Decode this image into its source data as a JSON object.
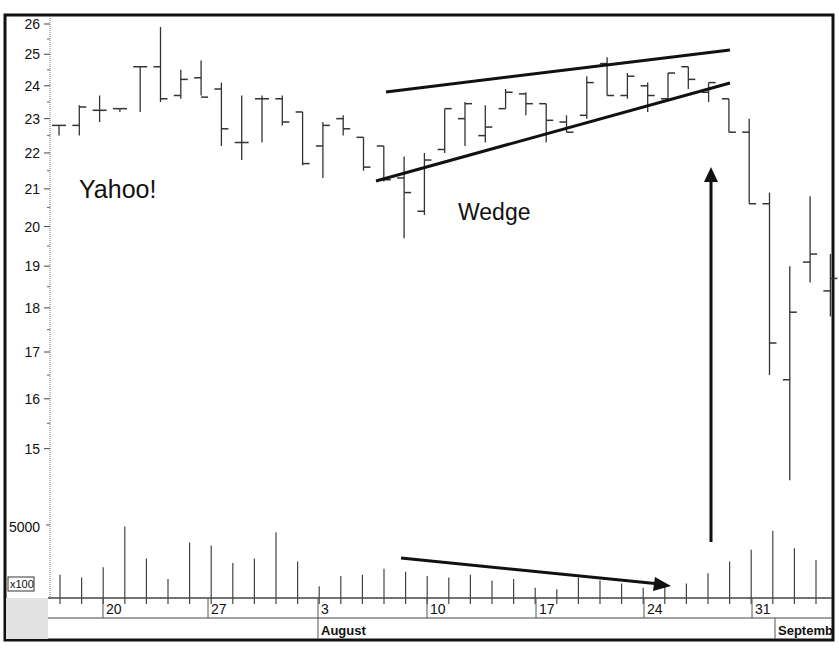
{
  "chart_data": {
    "type": "ohlc",
    "title": "",
    "annotations": {
      "stock_label": "Yahoo!",
      "pattern_label": "Wedge",
      "volume_multiplier_label": "x100"
    },
    "y_axis": {
      "scale": "log",
      "ticks": [
        26,
        25,
        24,
        23,
        22,
        21,
        20,
        19,
        18,
        17,
        16,
        15
      ],
      "ylim": [
        14.2,
        26.3
      ]
    },
    "volume_axis": {
      "ticks": [
        5000
      ],
      "unit": "x100"
    },
    "x_axis": {
      "day_ticks": [
        "20",
        "27",
        "3",
        "10",
        "17",
        "24",
        "31"
      ],
      "month_labels": [
        "August",
        "Septemb"
      ]
    },
    "bars": [
      {
        "date": "Jul 17",
        "open": 22.8,
        "high": 22.8,
        "low": 22.5,
        "close": 22.8
      },
      {
        "date": "Jul 18",
        "open": 22.8,
        "high": 23.4,
        "low": 22.5,
        "close": 23.35
      },
      {
        "date": "Jul 19",
        "open": 23.25,
        "high": 23.7,
        "low": 22.9,
        "close": 23.25
      },
      {
        "date": "Jul 20",
        "open": 23.3,
        "high": 23.3,
        "low": 23.2,
        "close": 23.3
      },
      {
        "date": "Jul 23",
        "open": 24.6,
        "high": 24.6,
        "low": 23.2,
        "close": 24.6
      },
      {
        "date": "Jul 24",
        "open": 24.6,
        "high": 25.9,
        "low": 23.5,
        "close": 23.6
      },
      {
        "date": "Jul 25",
        "open": 23.7,
        "high": 24.5,
        "low": 23.6,
        "close": 24.2
      },
      {
        "date": "Jul 26",
        "open": 24.25,
        "high": 24.8,
        "low": 23.7,
        "close": 23.65
      },
      {
        "date": "Jul 27",
        "open": 23.9,
        "high": 24.1,
        "low": 22.2,
        "close": 22.7
      },
      {
        "date": "Jul 30",
        "open": 22.3,
        "high": 23.7,
        "low": 21.8,
        "close": 22.3
      },
      {
        "date": "Jul 31",
        "open": 23.6,
        "high": 23.7,
        "low": 22.3,
        "close": 23.6
      },
      {
        "date": "Aug 1",
        "open": 23.6,
        "high": 23.7,
        "low": 22.8,
        "close": 22.9
      },
      {
        "date": "Aug 2",
        "open": 23.2,
        "high": 23.2,
        "low": 21.65,
        "close": 21.7
      },
      {
        "date": "Aug 3",
        "open": 22.2,
        "high": 22.9,
        "low": 21.3,
        "close": 22.8
      },
      {
        "date": "Aug 6",
        "open": 23.0,
        "high": 23.1,
        "low": 22.5,
        "close": 22.7
      },
      {
        "date": "Aug 7",
        "open": 22.45,
        "high": 22.45,
        "low": 21.5,
        "close": 21.6
      },
      {
        "date": "Aug 8",
        "open": 22.2,
        "high": 22.2,
        "low": 21.2,
        "close": 21.25
      },
      {
        "date": "Aug 9",
        "open": 21.3,
        "high": 21.9,
        "low": 19.7,
        "close": 20.9
      },
      {
        "date": "Aug 10",
        "open": 20.4,
        "high": 22.0,
        "low": 20.3,
        "close": 21.8
      },
      {
        "date": "Aug 13",
        "open": 22.1,
        "high": 23.3,
        "low": 22.0,
        "close": 23.3
      },
      {
        "date": "Aug 14",
        "open": 23.0,
        "high": 23.5,
        "low": 22.2,
        "close": 23.45
      },
      {
        "date": "Aug 15",
        "open": 22.5,
        "high": 23.4,
        "low": 22.3,
        "close": 22.75
      },
      {
        "date": "Aug 16",
        "open": 23.3,
        "high": 23.9,
        "low": 23.3,
        "close": 23.8
      },
      {
        "date": "Aug 17",
        "open": 23.75,
        "high": 23.8,
        "low": 23.1,
        "close": 23.45
      },
      {
        "date": "Aug 20",
        "open": 23.45,
        "high": 23.45,
        "low": 22.3,
        "close": 22.95
      },
      {
        "date": "Aug 21",
        "open": 22.9,
        "high": 23.1,
        "low": 22.6,
        "close": 22.6
      },
      {
        "date": "Aug 22",
        "open": 23.1,
        "high": 24.3,
        "low": 23.0,
        "close": 24.1
      },
      {
        "date": "Aug 23",
        "open": 24.7,
        "high": 24.9,
        "low": 23.7,
        "close": 23.7
      },
      {
        "date": "Aug 24",
        "open": 23.7,
        "high": 24.4,
        "low": 23.6,
        "close": 24.3
      },
      {
        "date": "Aug 27",
        "open": 24.0,
        "high": 24.1,
        "low": 23.2,
        "close": 23.7
      },
      {
        "date": "Aug 28",
        "open": 23.6,
        "high": 24.4,
        "low": 23.6,
        "close": 24.4
      },
      {
        "date": "Aug 29",
        "open": 24.6,
        "high": 24.6,
        "low": 23.9,
        "close": 24.2
      },
      {
        "date": "Aug 30",
        "open": 23.8,
        "high": 24.1,
        "low": 23.5,
        "close": 24.1
      },
      {
        "date": "Aug 31",
        "open": 23.6,
        "high": 23.6,
        "low": 22.6,
        "close": 22.6
      },
      {
        "date": "Sep 4",
        "open": 22.6,
        "high": 23.0,
        "low": 20.6,
        "close": 20.6
      },
      {
        "date": "Sep 5",
        "open": 20.6,
        "high": 20.9,
        "low": 16.5,
        "close": 17.2
      },
      {
        "date": "Sep 6",
        "open": 16.4,
        "high": 19.0,
        "low": 14.4,
        "close": 17.9
      },
      {
        "date": "Sep 7",
        "open": 19.1,
        "high": 20.8,
        "low": 18.6,
        "close": 19.3
      },
      {
        "date": "Sep 10",
        "open": 18.4,
        "high": 19.3,
        "low": 17.8,
        "close": 18.7
      }
    ],
    "volume": [
      1600,
      1400,
      2100,
      4900,
      2700,
      1300,
      3800,
      3600,
      2400,
      2700,
      4500,
      2500,
      800,
      1500,
      1600,
      2000,
      1800,
      1500,
      1400,
      1600,
      1200,
      1300,
      700,
      600,
      1400,
      1200,
      1000,
      700,
      800,
      1000,
      1700,
      2500,
      3300,
      4600,
      3400,
      2600
    ],
    "trendlines": [
      {
        "name": "wedge-upper",
        "from": [
          386,
          92
        ],
        "to": [
          730,
          50
        ]
      },
      {
        "name": "wedge-lower",
        "from": [
          376,
          181
        ],
        "to": [
          730,
          83
        ]
      },
      {
        "name": "volume-decline-arrow",
        "from": [
          401,
          558
        ],
        "to": [
          668,
          585
        ]
      },
      {
        "name": "breakdown-arrow",
        "from": [
          711,
          542
        ],
        "to": [
          711,
          168
        ]
      }
    ]
  }
}
